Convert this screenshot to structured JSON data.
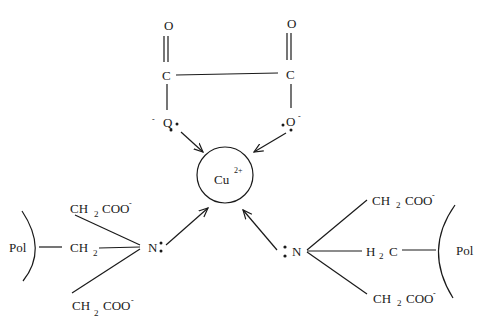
{
  "diagram": {
    "type": "chemical-structure",
    "center_ion": {
      "symbol": "Cu",
      "charge": "2+"
    },
    "oxalate": {
      "left_carbonyl_O": "O",
      "right_carbonyl_O": "O",
      "left_C": "C",
      "right_C": "C",
      "left_O": "Q",
      "right_O": "O",
      "charge": "-"
    },
    "left_ligand": {
      "polymer": "Pol",
      "linker_group": "CH",
      "linker_sub": "2",
      "nitrogen": "N",
      "arms": [
        {
          "group": "CH",
          "sub": "2",
          "acid": "COO",
          "charge": "-"
        },
        {
          "group": "CH",
          "sub": "2",
          "acid": "COO",
          "charge": "-"
        }
      ]
    },
    "right_ligand": {
      "polymer": "Pol",
      "linker_group_H": "H",
      "linker_sub": "2",
      "linker_group_C": "C",
      "nitrogen": "N",
      "arms": [
        {
          "group": "CH",
          "sub": "2",
          "acid": "COO",
          "charge": "-"
        },
        {
          "group": "CH",
          "sub": "2",
          "acid": "COO",
          "charge": "-"
        }
      ]
    }
  }
}
